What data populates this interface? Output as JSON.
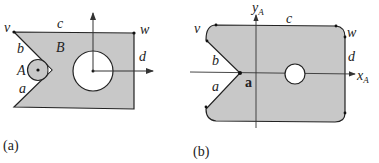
{
  "figure": {
    "colors": {
      "fill": "#c8c8c8",
      "stroke": "#222222",
      "background": "#ffffff"
    },
    "panels": [
      {
        "caption": "(a)",
        "labels": {
          "v": "v",
          "w": "w",
          "c": "c",
          "b": "b",
          "a": "a",
          "d": "d",
          "B": "B",
          "A": "A"
        },
        "description": "Obstacle B with a V-notch (edges a, b), top edge c, right edge d, a large circular hole with coordinate axes at its center, and a small circular robot A inside the notch."
      },
      {
        "caption": "(b)",
        "labels": {
          "v": "v",
          "w": "w",
          "c": "c",
          "b": "b",
          "a": "a",
          "d": "d",
          "y_axis": "y",
          "y_axis_sub": "A",
          "x_axis": "x",
          "x_axis_sub": "A",
          "reference_point": "a"
        },
        "description": "Configuration-space obstacle: grown shape with rounded corners, reference point a at notch apex, axes x_A and y_A, small remaining hole."
      }
    ]
  }
}
